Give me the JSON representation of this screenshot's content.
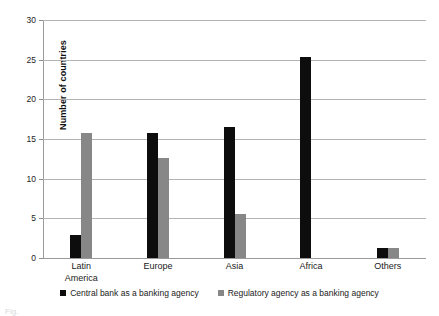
{
  "chart_data": {
    "type": "bar",
    "title": "",
    "xlabel": "",
    "ylabel": "Number of countries",
    "categories": [
      "Latin\nAmerica",
      "Europe",
      "Asia",
      "Africa",
      "Others"
    ],
    "ylim": [
      0,
      30
    ],
    "yticks": [
      0,
      5,
      10,
      15,
      20,
      25,
      30
    ],
    "grid": true,
    "legend_position": "bottom",
    "series": [
      {
        "name": "Central bank as a banking agency",
        "color": "#0d0d0d",
        "values": [
          2.9,
          15.7,
          16.5,
          25.4,
          1.3
        ]
      },
      {
        "name": "Regulatory agency as a banking agency",
        "color": "#878787",
        "values": [
          15.8,
          12.6,
          5.5,
          0,
          1.3
        ]
      }
    ]
  },
  "caption": "Fig."
}
